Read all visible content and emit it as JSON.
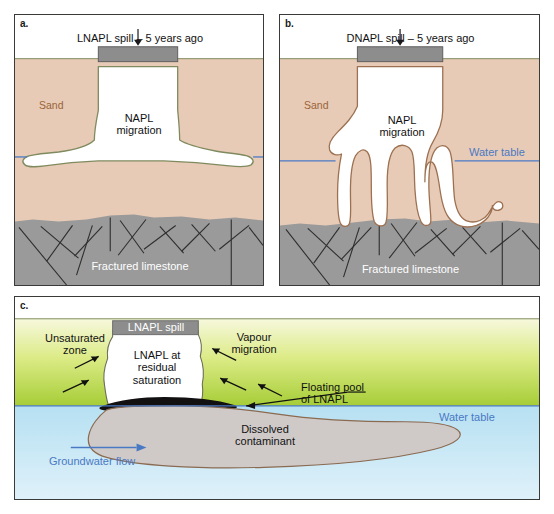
{
  "figure": {
    "panels": [
      {
        "id": "a",
        "letter": "a.",
        "title": "LNAPL spill – 5 years ago",
        "labels": {
          "sand": "Sand",
          "napl_migration": "NAPL\nmigration",
          "fractured_limestone": "Fractured limestone"
        }
      },
      {
        "id": "b",
        "letter": "b.",
        "title": "DNAPL spill – 5 years ago",
        "labels": {
          "sand": "Sand",
          "napl_migration": "NAPL\nmigration",
          "water_table": "Water table",
          "fractured_limestone": "Fractured limestone"
        }
      },
      {
        "id": "c",
        "letter": "c.",
        "labels": {
          "lnapl_spill": "LNAPL spill",
          "unsaturated_zone": "Unsaturated\nzone",
          "lnapl_residual": "LNAPL at\nresidual\nsaturation",
          "vapour_migration": "Vapour\nmigration",
          "floating_pool": "Floating pool\nof LNAPL",
          "water_table": "Water table",
          "dissolved_contaminant": "Dissolved\ncontaminant",
          "groundwater_flow": "Groundwater flow"
        }
      }
    ],
    "colors": {
      "sand": "#e7cbb6",
      "limestone": "#9a9a9a",
      "napl_white": "#ffffff",
      "napl_outline_lnapl": "#7f8a5e",
      "napl_outline_dnapl": "#9c7050",
      "water_table_line": "#4a79c4",
      "unsaturated_top": "#f2f5cf",
      "unsaturated_bottom": "#a9cf3f",
      "saturated_water": "#bfe3f2",
      "floating_pool": "#121010",
      "plume_fill": "#cfcac8",
      "plume_outline": "#8a6a50",
      "spill_box": "#8d8d8d",
      "panel_border": "#3a3a38",
      "sand_label": "#9a6438",
      "blue_text": "#4a79c4"
    }
  }
}
